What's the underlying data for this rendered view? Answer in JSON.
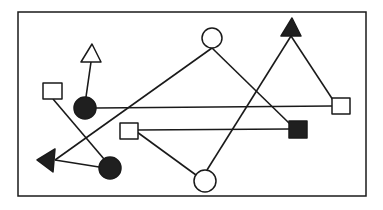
{
  "diagram": {
    "width": 383,
    "height": 210,
    "colors": {
      "stroke": "#1a1a1a",
      "fill_dark": "#1f1f1f",
      "fill_light": "#ffffff",
      "background": "#ffffff"
    },
    "frame": {
      "x": 18,
      "y": 12,
      "w": 348,
      "h": 184
    },
    "nodes": [
      {
        "id": "open-triangle-top-left",
        "shape": "triangle-up",
        "filled": false,
        "points": "92,44 81,62 101,62"
      },
      {
        "id": "open-square-left",
        "shape": "square",
        "filled": false,
        "x": 43,
        "y": 83,
        "w": 19,
        "h": 16
      },
      {
        "id": "filled-circle-left",
        "shape": "circle",
        "filled": true,
        "cx": 85,
        "cy": 108,
        "r": 11
      },
      {
        "id": "filled-triangle-left",
        "shape": "triangle-left",
        "filled": true,
        "points": "37,160 55,149 53,172"
      },
      {
        "id": "filled-circle-bottom-left",
        "shape": "circle",
        "filled": true,
        "cx": 110,
        "cy": 168,
        "r": 11
      },
      {
        "id": "open-circle-top",
        "shape": "circle",
        "filled": false,
        "cx": 212,
        "cy": 38,
        "r": 10
      },
      {
        "id": "filled-triangle-top-right",
        "shape": "triangle-up",
        "filled": true,
        "points": "292,18 281,36 301,36"
      },
      {
        "id": "open-square-right",
        "shape": "square",
        "filled": false,
        "x": 332,
        "y": 98,
        "w": 18,
        "h": 16
      },
      {
        "id": "open-square-middle",
        "shape": "square",
        "filled": false,
        "x": 120,
        "y": 123,
        "w": 18,
        "h": 16
      },
      {
        "id": "filled-square-right",
        "shape": "square",
        "filled": true,
        "x": 289,
        "y": 121,
        "w": 18,
        "h": 17
      },
      {
        "id": "open-circle-bottom",
        "shape": "circle",
        "filled": false,
        "cx": 205,
        "cy": 181,
        "r": 11
      }
    ],
    "edges": [
      {
        "from": "filled-circle-left",
        "to": "open-triangle-top-left",
        "x1": 86,
        "y1": 97,
        "x2": 91,
        "y2": 62
      },
      {
        "from": "open-square-left",
        "to": "filled-circle-bottom-left",
        "x1": 53,
        "y1": 99,
        "x2": 104,
        "y2": 159
      },
      {
        "from": "filled-circle-left",
        "to": "open-square-right",
        "x1": 96,
        "y1": 108,
        "x2": 332,
        "y2": 106
      },
      {
        "from": "open-circle-top",
        "to": "filled-triangle-left",
        "x1": 212,
        "y1": 48,
        "x2": 55,
        "y2": 160
      },
      {
        "from": "open-circle-top",
        "to": "filled-square-right",
        "x1": 212,
        "y1": 48,
        "x2": 290,
        "y2": 124
      },
      {
        "from": "filled-circle-bottom-left",
        "to": "filled-triangle-left",
        "x1": 99,
        "y1": 167,
        "x2": 55,
        "y2": 160
      },
      {
        "from": "filled-triangle-top-right",
        "to": "open-square-right",
        "x1": 291,
        "y1": 36,
        "x2": 333,
        "y2": 100
      },
      {
        "from": "filled-triangle-top-right",
        "to": "open-circle-bottom",
        "x1": 291,
        "y1": 36,
        "x2": 207,
        "y2": 170
      },
      {
        "from": "open-square-middle",
        "to": "filled-square-right",
        "x1": 138,
        "y1": 130,
        "x2": 289,
        "y2": 129
      },
      {
        "from": "open-square-middle",
        "to": "open-circle-bottom",
        "x1": 137,
        "y1": 132,
        "x2": 196,
        "y2": 175
      }
    ]
  }
}
